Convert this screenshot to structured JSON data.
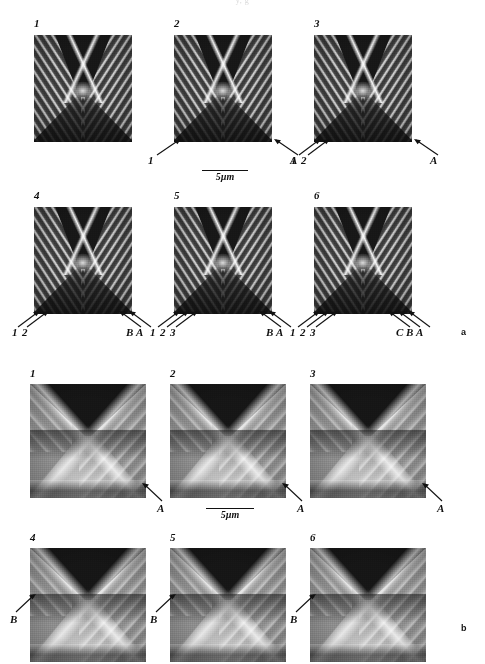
{
  "figure": {
    "clipped_header": "y, g",
    "groups": [
      {
        "id": "a",
        "letter": "a",
        "scale_bar": {
          "label": "5µm"
        },
        "rows": [
          {
            "cells": [
              {
                "number": "1",
                "left_markers": [],
                "right_markers": []
              },
              {
                "number": "2",
                "left_markers": [
                  "1"
                ],
                "right_markers": [
                  "A"
                ]
              },
              {
                "number": "3",
                "left_markers": [
                  "1",
                  "2"
                ],
                "right_markers": [
                  "A"
                ]
              }
            ]
          },
          {
            "cells": [
              {
                "number": "4",
                "left_markers": [
                  "1",
                  "2"
                ],
                "right_markers": [
                  "B",
                  "A"
                ]
              },
              {
                "number": "5",
                "left_markers": [
                  "1",
                  "2",
                  "3"
                ],
                "right_markers": [
                  "B",
                  "A"
                ]
              },
              {
                "number": "6",
                "left_markers": [
                  "1",
                  "2",
                  "3"
                ],
                "right_markers": [
                  "C",
                  "B",
                  "A"
                ]
              }
            ]
          }
        ]
      },
      {
        "id": "b",
        "letter": "b",
        "scale_bar": {
          "label": "5µm"
        },
        "rows": [
          {
            "cells": [
              {
                "number": "1",
                "left_markers": [],
                "right_markers": [
                  "A"
                ]
              },
              {
                "number": "2",
                "left_markers": [],
                "right_markers": [
                  "A"
                ]
              },
              {
                "number": "3",
                "left_markers": [],
                "right_markers": [
                  "A"
                ]
              }
            ]
          },
          {
            "cells": [
              {
                "number": "4",
                "left_markers": [
                  "B"
                ],
                "right_markers": []
              },
              {
                "number": "5",
                "left_markers": [
                  "B"
                ],
                "right_markers": []
              },
              {
                "number": "6",
                "left_markers": [
                  "B"
                ],
                "right_markers": []
              }
            ]
          }
        ]
      }
    ]
  }
}
